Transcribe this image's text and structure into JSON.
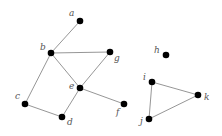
{
  "graph": {
    "nodes": [
      {
        "id": "a",
        "label": "a",
        "x": 80,
        "y": 21,
        "lx": 69,
        "ly": 16
      },
      {
        "id": "b",
        "label": "b",
        "x": 51,
        "y": 53,
        "lx": 40,
        "ly": 50
      },
      {
        "id": "c",
        "label": "c",
        "x": 25,
        "y": 104,
        "lx": 15,
        "ly": 99
      },
      {
        "id": "d",
        "label": "d",
        "x": 62,
        "y": 117,
        "lx": 67,
        "ly": 125
      },
      {
        "id": "e",
        "label": "e",
        "x": 80,
        "y": 88,
        "lx": 69,
        "ly": 89
      },
      {
        "id": "f",
        "label": "f",
        "x": 124,
        "y": 104,
        "lx": 116,
        "ly": 115
      },
      {
        "id": "g",
        "label": "g",
        "x": 110,
        "y": 52,
        "lx": 114,
        "ly": 61
      },
      {
        "id": "h",
        "label": "h",
        "x": 166,
        "y": 55,
        "lx": 154,
        "ly": 53
      },
      {
        "id": "i",
        "label": "i",
        "x": 152,
        "y": 82,
        "lx": 143,
        "ly": 80
      },
      {
        "id": "j",
        "label": "j",
        "x": 149,
        "y": 119,
        "lx": 140,
        "ly": 124
      },
      {
        "id": "k",
        "label": "k",
        "x": 198,
        "y": 95,
        "lx": 204,
        "ly": 100
      }
    ],
    "edges": [
      [
        "a",
        "b"
      ],
      [
        "b",
        "g"
      ],
      [
        "b",
        "e"
      ],
      [
        "b",
        "c"
      ],
      [
        "g",
        "e"
      ],
      [
        "e",
        "d"
      ],
      [
        "e",
        "f"
      ],
      [
        "c",
        "d"
      ],
      [
        "i",
        "k"
      ],
      [
        "i",
        "j"
      ],
      [
        "j",
        "k"
      ]
    ]
  }
}
